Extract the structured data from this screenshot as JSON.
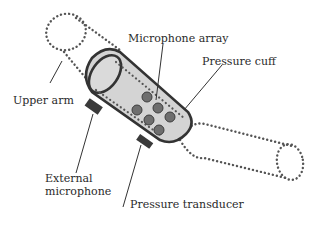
{
  "diagram": {
    "type": "schematic",
    "colors": {
      "cuff_fill": "#d4d4d4",
      "cuff_outline": "#333333",
      "dots": "#555555",
      "mic_fill": "#6e6e6e",
      "pad_fill": "#3a3a3a",
      "text": "#2a2a2a"
    },
    "labels": {
      "microphone_array": "Microphone array",
      "pressure_cuff": "Pressure cuff",
      "upper_arm": "Upper arm",
      "external_microphone_line1": "External",
      "external_microphone_line2": "microphone",
      "pressure_transducer": "Pressure transducer"
    },
    "components": [
      {
        "name": "Upper arm",
        "style": "dotted outline"
      },
      {
        "name": "Pressure cuff",
        "style": "gray cylinder"
      },
      {
        "name": "Microphone array",
        "count": 6
      },
      {
        "name": "External microphone",
        "style": "dark pad"
      },
      {
        "name": "Pressure transducer",
        "style": "dark pad"
      },
      {
        "name": "Forearm",
        "style": "dotted outline"
      }
    ]
  }
}
